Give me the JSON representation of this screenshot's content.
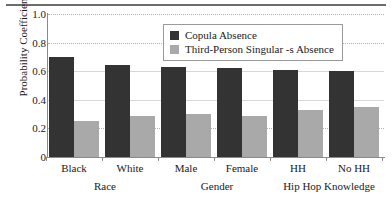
{
  "chart_data": {
    "type": "bar",
    "title": "",
    "xlabel": "",
    "ylabel": "Probability Coefficient",
    "ylim": [
      0,
      1.0
    ],
    "ytick_labels": [
      "0",
      "0.2",
      "0.4",
      "0.6",
      "0.8",
      "1.0"
    ],
    "ytick_values": [
      0,
      0.2,
      0.4,
      0.6,
      0.8,
      1.0
    ],
    "grid": true,
    "legend_position": "top-center",
    "categories": [
      "Black",
      "White",
      "Male",
      "Female",
      "HH",
      "No HH"
    ],
    "group_labels": [
      "Race",
      "Gender",
      "Hip Hop Knowledge"
    ],
    "series": [
      {
        "name": "Copula Absence",
        "color": "#333333",
        "values": [
          0.7,
          0.64,
          0.63,
          0.62,
          0.61,
          0.6
        ]
      },
      {
        "name": "Third-Person Singular -s Absence",
        "color": "#a9a9a9",
        "values": [
          0.25,
          0.29,
          0.3,
          0.29,
          0.33,
          0.35
        ]
      }
    ]
  },
  "legend": {
    "items": [
      {
        "label": "Copula Absence",
        "swatch": "dark"
      },
      {
        "label": "Third-Person Singular -s Absence",
        "swatch": "light"
      }
    ]
  }
}
